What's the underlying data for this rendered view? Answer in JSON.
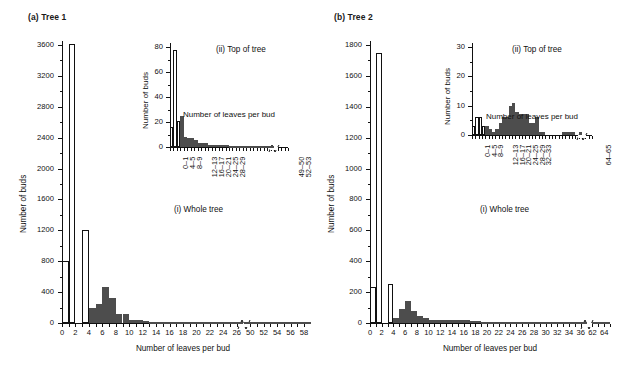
{
  "figure": {
    "width": 620,
    "height": 382,
    "background": "#ffffff",
    "bar_open_color": "#ffffff",
    "bar_filled_color": "#4d4d4d",
    "axis_color": "#111111"
  },
  "panels": [
    {
      "id": "panel-a",
      "label": "(a) Tree 1",
      "main": {
        "caption": "(i) Whole tree",
        "xlabel": "Number of leaves per bud",
        "ylabel": "Number of buds"
      },
      "inset": {
        "caption": "(ii) Top of tree",
        "xlabel": "Number of leaves per bud",
        "ylabel": "Number of buds"
      }
    },
    {
      "id": "panel-b",
      "label": "(b) Tree 2",
      "main": {
        "caption": "(i) Whole tree",
        "xlabel": "Number of leaves per bud",
        "ylabel": "Number of buds"
      },
      "inset": {
        "caption": "(ii) Top of tree",
        "xlabel": "Number of leaves per bud",
        "ylabel": "Number of buds"
      }
    }
  ],
  "chart_data": [
    {
      "id": "tree1-whole-tree",
      "type": "bar",
      "title": "(a) Tree 1 — (i) Whole tree",
      "xlabel": "Number of leaves per bud",
      "ylabel": "Number of buds",
      "ylim": [
        0,
        3600
      ],
      "ytick_step": 400,
      "yticks": [
        0,
        400,
        800,
        1200,
        1600,
        2000,
        2400,
        2800,
        3200,
        3600
      ],
      "xticks": [
        0,
        2,
        4,
        6,
        8,
        10,
        12,
        14,
        16,
        18,
        20,
        22,
        24,
        26,
        50,
        52,
        54,
        56,
        58
      ],
      "xlim": [
        0,
        28
      ],
      "axis_break": true,
      "axis_break_after": 27,
      "grid": false,
      "legend": "none",
      "series": [
        {
          "name": "Number of buds (open bars)",
          "style": "open",
          "x": [
            0,
            1,
            2,
            3
          ],
          "values": [
            800,
            3610,
            0,
            1210
          ]
        },
        {
          "name": "Number of buds (filled bars)",
          "style": "filled",
          "x": [
            0,
            1,
            2,
            3,
            4,
            5,
            6,
            7,
            8,
            9,
            10,
            11,
            12,
            13,
            14,
            15,
            16,
            17,
            18,
            19,
            20,
            21,
            22,
            23,
            24,
            25,
            26,
            27,
            50,
            51,
            52,
            53,
            54,
            55,
            56,
            57,
            58
          ],
          "values": [
            0,
            0,
            0,
            115,
            200,
            240,
            470,
            330,
            120,
            120,
            45,
            45,
            20,
            18,
            14,
            12,
            10,
            9,
            8,
            7,
            6,
            5,
            5,
            4,
            4,
            3,
            3,
            2,
            6,
            4,
            3,
            2,
            2,
            2,
            1,
            1,
            1
          ]
        }
      ]
    },
    {
      "id": "tree1-top-of-tree",
      "type": "bar",
      "title": "(a) Tree 1 — (ii) Top of tree",
      "xlabel": "Number of leaves per bud",
      "ylabel": "Number of buds",
      "ylim": [
        0,
        80
      ],
      "ytick_step": 20,
      "yticks": [
        0,
        20,
        40,
        60,
        80
      ],
      "xtick_labels": [
        "0–1",
        "4–5",
        "8–9",
        "12–13",
        "16–17",
        "20–21",
        "24–25",
        "28–29",
        "49–50",
        "52–53"
      ],
      "axis_break": true,
      "grid": false,
      "legend": "none",
      "series": [
        {
          "name": "Number of buds (open bars)",
          "style": "open",
          "bin_index": [
            0,
            1,
            2
          ],
          "values": [
            16,
            78,
            21
          ]
        },
        {
          "name": "Number of buds (filled bars)",
          "style": "filled",
          "bin_index": [
            0,
            1,
            2,
            3,
            4,
            5,
            6,
            7,
            8,
            9,
            10,
            11,
            12,
            13,
            14,
            15,
            16,
            17,
            18,
            19,
            20,
            21,
            22,
            23,
            24,
            25,
            26,
            27,
            28,
            29
          ],
          "values": [
            2,
            3,
            16,
            25,
            8,
            7,
            7,
            6,
            3,
            3,
            3,
            2,
            2,
            2,
            2,
            2,
            2,
            1,
            1,
            1,
            1,
            1,
            1,
            1,
            1,
            1,
            1,
            1,
            1,
            1
          ]
        }
      ]
    },
    {
      "id": "tree2-whole-tree",
      "type": "bar",
      "title": "(b) Tree 2 — (i) Whole tree",
      "xlabel": "Number of leaves per bud",
      "ylabel": "Number of buds",
      "ylim": [
        0,
        1800
      ],
      "ytick_step": 200,
      "yticks": [
        0,
        200,
        400,
        600,
        800,
        1000,
        1200,
        1400,
        1600,
        1800
      ],
      "xticks": [
        0,
        2,
        4,
        6,
        8,
        10,
        12,
        14,
        16,
        18,
        20,
        22,
        24,
        26,
        28,
        30,
        32,
        34,
        36,
        62,
        64
      ],
      "axis_break": true,
      "grid": false,
      "legend": "none",
      "series": [
        {
          "name": "Number of buds (open bars)",
          "style": "open",
          "x": [
            0,
            1,
            2,
            3
          ],
          "values": [
            230,
            1750,
            0,
            255
          ]
        },
        {
          "name": "Number of buds (filled bars)",
          "style": "filled",
          "x": [
            0,
            1,
            2,
            3,
            4,
            5,
            6,
            7,
            8,
            9,
            10,
            11,
            12,
            13,
            14,
            15,
            16,
            17,
            18,
            19,
            20,
            21,
            22,
            23,
            24,
            25,
            26,
            27,
            28,
            29,
            30,
            31,
            32,
            33,
            34,
            35,
            36,
            62,
            63,
            64
          ],
          "values": [
            0,
            0,
            0,
            12,
            30,
            90,
            140,
            80,
            48,
            30,
            22,
            20,
            22,
            22,
            22,
            20,
            18,
            12,
            10,
            8,
            8,
            6,
            6,
            6,
            5,
            5,
            5,
            5,
            4,
            4,
            4,
            3,
            3,
            3,
            2,
            2,
            2,
            3,
            2,
            2
          ]
        }
      ]
    },
    {
      "id": "tree2-top-of-tree",
      "type": "bar",
      "title": "(b) Tree 2 — (ii) Top of tree",
      "xlabel": "Number of leaves per bud",
      "ylabel": "Number of buds",
      "ylim": [
        0,
        30
      ],
      "ytick_step": 10,
      "yticks": [
        0,
        10,
        20,
        30
      ],
      "xtick_labels": [
        "0–1",
        "4–5",
        "8–9",
        "12–13",
        "16–17",
        "20–21",
        "24–25",
        "28–29",
        "32–33",
        "64–65"
      ],
      "axis_break": true,
      "grid": false,
      "legend": "none",
      "series": [
        {
          "name": "Number of buds (open bars)",
          "style": "open",
          "bin_index": [
            0,
            1,
            2,
            3
          ],
          "values": [
            3,
            6,
            6,
            3
          ]
        },
        {
          "name": "Number of buds (filled bars)",
          "style": "filled",
          "bin_index": [
            0,
            1,
            2,
            3,
            4,
            5,
            6,
            7,
            8,
            9,
            10,
            11,
            12,
            13,
            14,
            15,
            16,
            17,
            18,
            19,
            20,
            21,
            22,
            23,
            24,
            25,
            26,
            27,
            28,
            29,
            30,
            31,
            32
          ],
          "values": [
            1,
            1,
            1,
            2,
            3,
            2,
            1,
            2,
            4,
            6,
            6,
            10,
            11,
            8,
            7,
            7,
            7,
            4,
            4,
            6,
            1,
            1,
            0,
            0,
            0,
            0,
            0,
            1,
            1,
            1,
            1,
            0,
            1
          ]
        }
      ]
    }
  ]
}
